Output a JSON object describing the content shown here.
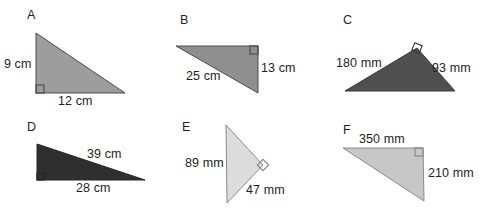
{
  "page": {
    "background": "#ffffff",
    "ink": "#231f20",
    "width": 482,
    "height": 213
  },
  "figures": [
    {
      "letter": "A",
      "letter_pos": {
        "x": 27,
        "y": 9
      },
      "fill": "#9d9d9d",
      "stroke": "#4d4d4d",
      "right_angle_at": "bottom-left",
      "points": "36,33 36,93 125,93",
      "labels": [
        {
          "text": "9 cm",
          "x": 4,
          "y": 58,
          "name": "dimension-label-9cm"
        },
        {
          "text": "12 cm",
          "x": 58,
          "y": 95,
          "name": "dimension-label-12cm"
        }
      ],
      "right_angle_marker": {
        "x": 36,
        "y": 93,
        "dx": 1,
        "dy": -1,
        "size": 8
      }
    },
    {
      "letter": "B",
      "letter_pos": {
        "x": 180,
        "y": 14
      },
      "fill": "#8f8f8f",
      "stroke": "#4d4d4d",
      "right_angle_at": "top-right",
      "points": "176,46 258,46 258,93",
      "labels": [
        {
          "text": "25 cm",
          "x": 186,
          "y": 70,
          "name": "dimension-label-25cm"
        },
        {
          "text": "13 cm",
          "x": 261,
          "y": 62,
          "name": "dimension-label-13cm"
        }
      ],
      "right_angle_marker": {
        "x": 258,
        "y": 46,
        "dx": -1,
        "dy": 1,
        "size": 8
      }
    },
    {
      "letter": "C",
      "letter_pos": {
        "x": 343,
        "y": 14
      },
      "fill": "#4f4f4f",
      "stroke": "#3a3a3a",
      "right_angle_at": "apex",
      "points": "345,91 417,48 455,91",
      "labels": [
        {
          "text": "180 mm",
          "x": 336,
          "y": 57,
          "name": "dimension-label-180mm"
        },
        {
          "text": "93 mm",
          "x": 432,
          "y": 62,
          "name": "dimension-label-93mm"
        }
      ],
      "right_angle_marker": {
        "x": 417,
        "y": 48,
        "rotate": 23,
        "size": 8
      }
    },
    {
      "letter": "D",
      "letter_pos": {
        "x": 27,
        "y": 121
      },
      "fill": "#2f2f2f",
      "stroke": "#262626",
      "right_angle_at": "bottom-left",
      "points": "37,144 37,180 145,180",
      "labels": [
        {
          "text": "39 cm",
          "x": 87,
          "y": 148,
          "name": "dimension-label-39cm"
        },
        {
          "text": "28 cm",
          "x": 76,
          "y": 182,
          "name": "dimension-label-28cm"
        }
      ],
      "right_angle_marker": {
        "x": 37,
        "y": 180,
        "dx": 1,
        "dy": -1,
        "size": 7
      }
    },
    {
      "letter": "E",
      "letter_pos": {
        "x": 182,
        "y": 121
      },
      "fill": "#dcdcdc",
      "stroke": "#8a8a8a",
      "right_angle_at": "right",
      "points": "226,125 227,203 263,165",
      "labels": [
        {
          "text": "89 mm",
          "x": 185,
          "y": 157,
          "name": "dimension-label-89mm"
        },
        {
          "text": "47 mm",
          "x": 246,
          "y": 184,
          "name": "dimension-label-47mm"
        }
      ],
      "right_angle_marker": {
        "x": 263,
        "y": 165,
        "rotate": 45,
        "size": 8
      }
    },
    {
      "letter": "F",
      "letter_pos": {
        "x": 343,
        "y": 124
      },
      "fill": "#c7c7c7",
      "stroke": "#8a8a8a",
      "right_angle_at": "top-right",
      "points": "343,148 423,148 424,201",
      "labels": [
        {
          "text": "350 mm",
          "x": 359,
          "y": 133,
          "name": "dimension-label-350mm"
        },
        {
          "text": "210 mm",
          "x": 428,
          "y": 167,
          "name": "dimension-label-210mm"
        }
      ],
      "right_angle_marker": {
        "x": 423,
        "y": 148,
        "dx": -1,
        "dy": 1,
        "size": 8
      }
    }
  ]
}
